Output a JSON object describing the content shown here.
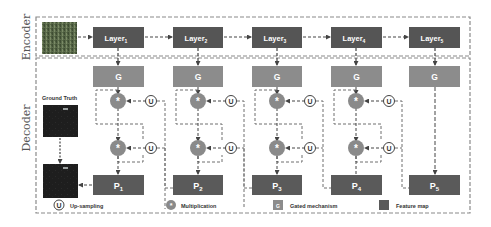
{
  "sections": {
    "encoder_label": "Encoder",
    "decoder_label": "Decoder"
  },
  "encoder": {
    "input_image": "input-aerial-image",
    "layers": [
      {
        "label": "Layer",
        "sub": "1"
      },
      {
        "label": "Layer",
        "sub": "2"
      },
      {
        "label": "Layer",
        "sub": "3"
      },
      {
        "label": "Layer",
        "sub": "4"
      },
      {
        "label": "Layer",
        "sub": "5"
      }
    ]
  },
  "decoder": {
    "gates": [
      {
        "label": "G"
      },
      {
        "label": "G"
      },
      {
        "label": "G"
      },
      {
        "label": "G"
      },
      {
        "label": "G"
      }
    ],
    "multiply_symbol": "*",
    "upsample_symbol": "U",
    "predictions": [
      {
        "label": "P",
        "sub": "1"
      },
      {
        "label": "P",
        "sub": "2"
      },
      {
        "label": "P",
        "sub": "3"
      },
      {
        "label": "P",
        "sub": "4"
      },
      {
        "label": "P",
        "sub": "5"
      }
    ],
    "ground_truth_label": "Ground Truth"
  },
  "legend": {
    "items": [
      {
        "symbol": "U",
        "label": "Up-sampling"
      },
      {
        "symbol": "*",
        "label": "Multiplication"
      },
      {
        "symbol": "G",
        "label": "Gated mechanism"
      },
      {
        "symbol": "",
        "label": "Feature map"
      }
    ]
  },
  "colors": {
    "layer_fill": "#555555",
    "gate_fill": "#8c8c8c",
    "pred_fill": "#5a5a5a",
    "multiply_fill": "#8a8a8a",
    "dash_stroke": "#6e6e6e",
    "frame_stroke": "#8a8a8a",
    "text_light": "#ffffff",
    "text_dark": "#333333"
  }
}
